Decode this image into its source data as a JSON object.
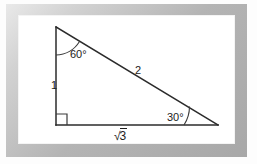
{
  "figure": {
    "kind": "right-triangle-diagram",
    "frame_color": "#b4b4b4",
    "paper_color": "#ffffff",
    "stroke_color": "#2b2b2b",
    "vertices": {
      "apex": {
        "x": 56,
        "y": 30
      },
      "right_angle": {
        "x": 56,
        "y": 128
      },
      "base_right": {
        "x": 218,
        "y": 128
      }
    },
    "angles": {
      "top": "60°",
      "bottom_right": "30°",
      "bottom_left": "90°"
    },
    "sides": {
      "vertical_leg": "1",
      "hypotenuse": "2",
      "base_symbol": "√",
      "base_radicand": "3"
    }
  }
}
